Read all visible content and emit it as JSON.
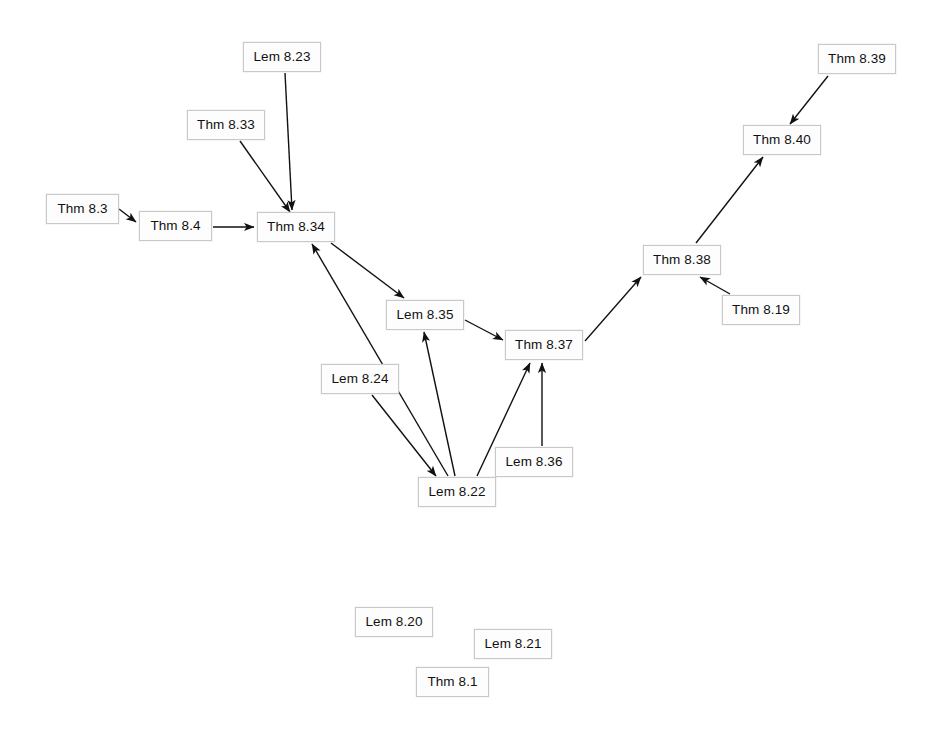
{
  "diagram": {
    "background_color": "#ffffff",
    "node_fill_color": "#fdfdfd",
    "node_border_color": "#c9c9c9",
    "edge_color": "#111111",
    "text_color": "#111111",
    "width": 937,
    "height": 739,
    "caption": ""
  },
  "chart_data": {
    "type": "diagram",
    "subtype": "directed-acyclic-graph",
    "node_count": 17,
    "edge_count": 16,
    "nodes": [
      {
        "id": "thm-8-3",
        "label": "Thm 8.3",
        "x": 46,
        "y": 194,
        "w": 73,
        "h": 30
      },
      {
        "id": "thm-8-4",
        "label": "Thm 8.4",
        "x": 139,
        "y": 211,
        "w": 73,
        "h": 30
      },
      {
        "id": "lem-8-23",
        "label": "Lem 8.23",
        "x": 243,
        "y": 42,
        "w": 78,
        "h": 30
      },
      {
        "id": "thm-8-33",
        "label": "Thm 8.33",
        "x": 187,
        "y": 110,
        "w": 78,
        "h": 30
      },
      {
        "id": "thm-8-34",
        "label": "Thm 8.34",
        "x": 257,
        "y": 212,
        "w": 78,
        "h": 30
      },
      {
        "id": "lem-8-35",
        "label": "Lem 8.35",
        "x": 386,
        "y": 300,
        "w": 78,
        "h": 30
      },
      {
        "id": "thm-8-37",
        "label": "Thm 8.37",
        "x": 505,
        "y": 330,
        "w": 78,
        "h": 30
      },
      {
        "id": "thm-8-38",
        "label": "Thm 8.38",
        "x": 643,
        "y": 245,
        "w": 78,
        "h": 30
      },
      {
        "id": "thm-8-19",
        "label": "Thm 8.19",
        "x": 722,
        "y": 295,
        "w": 78,
        "h": 30
      },
      {
        "id": "thm-8-40",
        "label": "Thm 8.40",
        "x": 743,
        "y": 125,
        "w": 78,
        "h": 30
      },
      {
        "id": "thm-8-39",
        "label": "Thm 8.39",
        "x": 818,
        "y": 44,
        "w": 78,
        "h": 30
      },
      {
        "id": "lem-8-24",
        "label": "Lem 8.24",
        "x": 321,
        "y": 364,
        "w": 78,
        "h": 30
      },
      {
        "id": "lem-8-36",
        "label": "Lem 8.36",
        "x": 495,
        "y": 447,
        "w": 78,
        "h": 30
      },
      {
        "id": "lem-8-22",
        "label": "Lem 8.22",
        "x": 418,
        "y": 477,
        "w": 78,
        "h": 30
      },
      {
        "id": "lem-8-20",
        "label": "Lem 8.20",
        "x": 355,
        "y": 607,
        "w": 78,
        "h": 30
      },
      {
        "id": "lem-8-21",
        "label": "Lem 8.21",
        "x": 474,
        "y": 629,
        "w": 78,
        "h": 30
      },
      {
        "id": "thm-8-1",
        "label": "Thm 8.1",
        "x": 416,
        "y": 667,
        "w": 73,
        "h": 30
      }
    ],
    "edges": [
      {
        "from": "thm-8-3",
        "to": "thm-8-4",
        "x1": 119,
        "y1": 209,
        "x2": 136,
        "y2": 222
      },
      {
        "from": "thm-8-4",
        "to": "thm-8-34",
        "x1": 213,
        "y1": 227,
        "x2": 254,
        "y2": 227
      },
      {
        "from": "lem-8-23",
        "to": "thm-8-34",
        "x1": 285,
        "y1": 73,
        "x2": 292,
        "y2": 210
      },
      {
        "from": "thm-8-33",
        "to": "thm-8-34",
        "x1": 240,
        "y1": 141,
        "x2": 290,
        "y2": 212
      },
      {
        "from": "thm-8-34",
        "to": "lem-8-35",
        "x1": 331,
        "y1": 243,
        "x2": 404,
        "y2": 298
      },
      {
        "from": "lem-8-22",
        "to": "thm-8-34",
        "x1": 448,
        "y1": 476,
        "x2": 312,
        "y2": 244
      },
      {
        "from": "lem-8-24",
        "to": "lem-8-22",
        "x1": 372,
        "y1": 395,
        "x2": 436,
        "y2": 476
      },
      {
        "from": "lem-8-22",
        "to": "lem-8-35",
        "x1": 455,
        "y1": 476,
        "x2": 424,
        "y2": 332
      },
      {
        "from": "lem-8-35",
        "to": "thm-8-37",
        "x1": 465,
        "y1": 320,
        "x2": 503,
        "y2": 340
      },
      {
        "from": "lem-8-22",
        "to": "thm-8-37",
        "x1": 477,
        "y1": 476,
        "x2": 530,
        "y2": 363
      },
      {
        "from": "lem-8-36",
        "to": "thm-8-37",
        "x1": 542,
        "y1": 446,
        "x2": 542,
        "y2": 363
      },
      {
        "from": "lem-8-36",
        "to": "lem-8-22",
        "x1": 520,
        "y1": 462,
        "x2": 498,
        "y2": 471
      },
      {
        "from": "thm-8-37",
        "to": "thm-8-38",
        "x1": 585,
        "y1": 341,
        "x2": 641,
        "y2": 277
      },
      {
        "from": "thm-8-19",
        "to": "thm-8-38",
        "x1": 730,
        "y1": 294,
        "x2": 700,
        "y2": 277
      },
      {
        "from": "thm-8-38",
        "to": "thm-8-40",
        "x1": 696,
        "y1": 243,
        "x2": 763,
        "y2": 157
      },
      {
        "from": "thm-8-39",
        "to": "thm-8-40",
        "x1": 828,
        "y1": 76,
        "x2": 790,
        "y2": 124
      }
    ],
    "legend": [],
    "xlabel": "",
    "ylabel": ""
  }
}
